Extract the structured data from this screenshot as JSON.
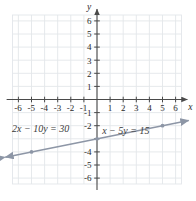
{
  "figure": {
    "kind": "coordinate-plane-line-graph",
    "width": 196,
    "height": 201,
    "background": "#ffffff",
    "grid_color": "#e3e6ea",
    "axis_color": "#4a4a4a",
    "line_color": "#8d96a6",
    "point_color": "#8d96a6",
    "text_color": "#2b2b2b"
  },
  "axes": {
    "x_label": "x",
    "y_label": "y",
    "x_ticks": [
      "-6",
      "-5",
      "-4",
      "-3",
      "-2",
      "-1",
      "1",
      "2",
      "3",
      "4",
      "5",
      "6"
    ],
    "y_ticks": [
      "6",
      "5",
      "4",
      "3",
      "2",
      "1",
      "-1",
      "-2",
      "-4",
      "-5",
      "-6"
    ],
    "xlim": [
      -7,
      7
    ],
    "ylim": [
      -7,
      7
    ],
    "grid": true,
    "origin_label": ""
  },
  "labels": {
    "equation_left": "2x − 10y = 30",
    "equation_right": "x − 5y = 15"
  },
  "chart_data": {
    "type": "line",
    "title": "",
    "xlabel": "x",
    "ylabel": "y",
    "xlim": [
      -7,
      7
    ],
    "ylim": [
      -7,
      7
    ],
    "grid": true,
    "legend": "none",
    "series": [
      {
        "name": "x − 5y = 15",
        "equation": "x - 5y = 15",
        "equivalent_equation": "2x - 10y = 30",
        "slope": 0.2,
        "y_intercept": -3,
        "x_intercept": 15,
        "x": [
          -7,
          7
        ],
        "values": [
          -4.4,
          -1.6
        ],
        "points": [
          {
            "x": -5,
            "y": -4
          },
          {
            "x": 0,
            "y": -3
          },
          {
            "x": 5,
            "y": -2
          }
        ],
        "arrows": "both"
      }
    ],
    "annotations": [
      {
        "text": "2x − 10y = 30",
        "x": -4.3,
        "y": -2.45
      },
      {
        "text": "x − 5y = 15",
        "x": 2.2,
        "y": -2.6
      }
    ]
  }
}
